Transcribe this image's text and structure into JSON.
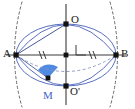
{
  "figure": {
    "width": 135,
    "height": 109,
    "background_color": "#ffffff"
  },
  "colors": {
    "axis": "#3a3a3a",
    "point": "#111111",
    "ellipse": "#5a6fc0",
    "lens_arc": "#5a6fc0",
    "dashed_arc": "#6b6b6b",
    "dashed_chord": "#8a93c4",
    "blue_fill": "#3f7fe0",
    "blue_fill_alt": "#4a86e8",
    "label_text": "#1a1a1a",
    "label_blue": "#3f63c8"
  },
  "labels": {
    "a": "A",
    "b": "B",
    "o": "O",
    "o_prime": "O'",
    "m": "M"
  },
  "points": {
    "A": {
      "name": "A",
      "x": 16,
      "y": 55
    },
    "B": {
      "name": "B",
      "x": 116,
      "y": 55
    },
    "O": {
      "name": "O",
      "x": 66,
      "y": 24
    },
    "O_prime": {
      "name": "O'",
      "x": 66,
      "y": 86
    },
    "center": {
      "name": "center",
      "x": 66,
      "y": 55
    },
    "M": {
      "name": "M",
      "x": 48,
      "y": 78
    }
  },
  "label_positions": {
    "A": {
      "x": 3,
      "y": 49
    },
    "B": {
      "x": 121,
      "y": 49
    },
    "O": {
      "x": 71,
      "y": 15
    },
    "O_prime": {
      "x": 70,
      "y": 87
    },
    "M": {
      "x": 43,
      "y": 91
    }
  },
  "tick_marks": {
    "style": "double-slash",
    "count_per_segment": 2,
    "segments": [
      {
        "name": "A-to-center",
        "x": 41,
        "y": 55
      },
      {
        "name": "center-to-B",
        "x": 91,
        "y": 55
      }
    ]
  },
  "right_angle": {
    "name": "right-angle-marker",
    "vertex_x": 66,
    "vertex_y": 55,
    "size": 10,
    "orientation": "up-right"
  },
  "ellipse": {
    "cx": 66,
    "cy": 55,
    "rx": 50,
    "ry": 31,
    "stroke_width": 1
  },
  "lens_arcs": {
    "description": "Two circular arcs through A and B forming a lens/vesica shape",
    "upper_sagitta": 25,
    "lower_sagitta": 25
  },
  "dashed_side_arcs": {
    "left": {
      "through_x": 16,
      "bulge": 9
    },
    "right": {
      "through_x": 116,
      "bulge": 9
    }
  },
  "blue_region": {
    "name": "shaded-sector",
    "description": "Filled blue sector near point M",
    "fill": "#3f7fe0"
  },
  "chord_AO": {
    "name": "segment-A-O",
    "from": "A",
    "to": "O",
    "style": "solid"
  },
  "chord_AB_dashed": {
    "name": "dashed-chord-A-B",
    "from": "A",
    "to": "B",
    "style": "dashed"
  }
}
